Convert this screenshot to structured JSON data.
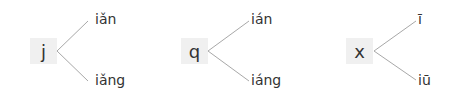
{
  "groups": [
    {
      "initial": "j",
      "finals": [
        "iǎn",
        "iǎng"
      ]
    },
    {
      "initial": "q",
      "finals": [
        "ián",
        "iáng"
      ]
    },
    {
      "initial": "x",
      "finals": [
        "ī",
        "iū"
      ]
    }
  ]
}
